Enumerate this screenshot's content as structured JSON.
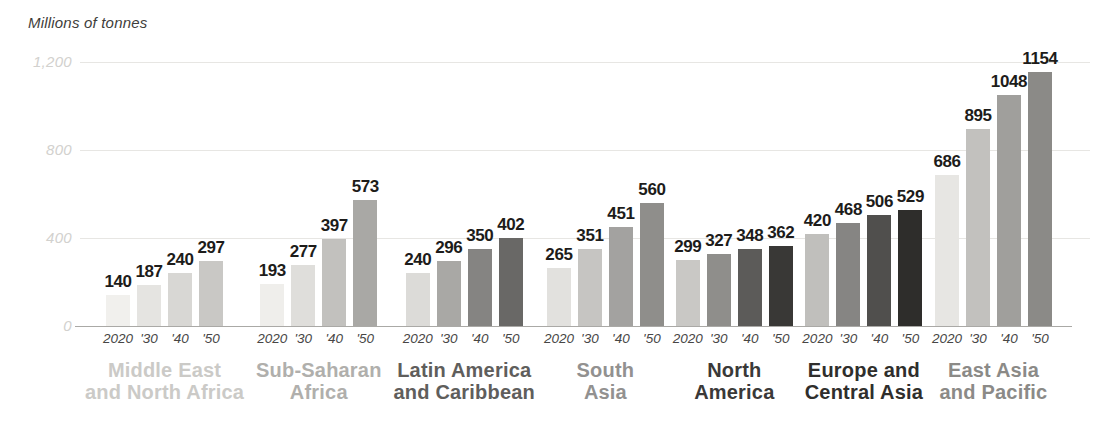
{
  "chart_data": {
    "type": "bar",
    "title": "Millions of tonnes",
    "ylabel": "Millions of tonnes",
    "xlabel": "",
    "ylim": [
      0,
      1200
    ],
    "grid": true,
    "legend_position": "none",
    "yticks": [
      {
        "value": 0,
        "label": "0"
      },
      {
        "value": 400,
        "label": "400"
      },
      {
        "value": 800,
        "label": "800"
      },
      {
        "value": 1200,
        "label": "1,200"
      }
    ],
    "x_ticks_per_group": [
      "2020",
      "'30",
      "'40",
      "'50"
    ],
    "value_label_color": "#1d1c1a",
    "tick_label_color": "#474645",
    "axis_label_color": "#d2d1ce",
    "gridline_color": "#e7e6e3",
    "baseline_color": "#aaa9a6",
    "groups": [
      {
        "name": "Middle East and North Africa",
        "label_lines": [
          "Middle East",
          "and North Africa"
        ],
        "label_color": "#cbcac7",
        "values": [
          140,
          187,
          240,
          297
        ],
        "bar_colors": [
          "#f1f0ed",
          "#e5e4e1",
          "#d8d7d4",
          "#c9c8c5"
        ]
      },
      {
        "name": "Sub-Saharan Africa",
        "label_lines": [
          "Sub-Saharan",
          "Africa"
        ],
        "label_color": "#b0afac",
        "values": [
          193,
          277,
          397,
          573
        ],
        "bar_colors": [
          "#efeeeb",
          "#dfdedb",
          "#c2c1be",
          "#a9a8a5"
        ]
      },
      {
        "name": "Latin America and Caribbean",
        "label_lines": [
          "Latin America",
          "and Caribbean"
        ],
        "label_color": "#5f5e5c",
        "values": [
          240,
          296,
          350,
          402
        ],
        "bar_colors": [
          "#dcdbd8",
          "#a9a8a5",
          "#858482",
          "#696866"
        ]
      },
      {
        "name": "South Asia",
        "label_lines": [
          "South",
          "Asia"
        ],
        "label_color": "#929190",
        "values": [
          265,
          351,
          451,
          560
        ],
        "bar_colors": [
          "#e2e1de",
          "#c6c5c2",
          "#a3a2a0",
          "#8f8e8b"
        ]
      },
      {
        "name": "North America",
        "label_lines": [
          "North",
          "America"
        ],
        "label_color": "#3a3938",
        "values": [
          299,
          327,
          348,
          362
        ],
        "bar_colors": [
          "#c9c8c5",
          "#8f8e8b",
          "#5c5b59",
          "#393836"
        ]
      },
      {
        "name": "Europe and Central Asia",
        "label_lines": [
          "Europe and",
          "Central Asia"
        ],
        "label_color": "#2f2e2c",
        "values": [
          420,
          468,
          506,
          529
        ],
        "bar_colors": [
          "#c0bfbc",
          "#868583",
          "#504f4d",
          "#2e2d2b"
        ]
      },
      {
        "name": "East Asia and Pacific",
        "label_lines": [
          "East Asia",
          "and Pacific"
        ],
        "label_color": "#8b8a87",
        "values": [
          686,
          895,
          1048,
          1154
        ],
        "bar_colors": [
          "#e7e6e3",
          "#c2c1be",
          "#a09f9c",
          "#8b8a87"
        ]
      }
    ]
  }
}
